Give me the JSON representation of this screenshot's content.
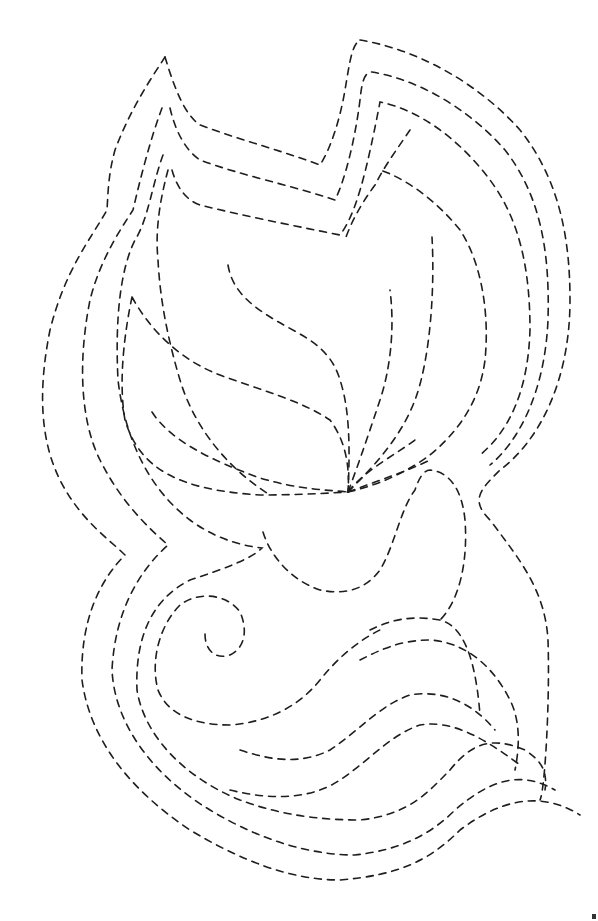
{
  "artwork": {
    "subject": "leaf and swirl quilting pattern",
    "style": "dashed stitch lines",
    "colors": {
      "background": "#ffffff",
      "stroke": "#1e1e1e"
    },
    "elements": [
      "outer-contour-1",
      "outer-contour-2",
      "outer-contour-3",
      "inner-contour-4",
      "leaf-outline",
      "leaf-vein-1",
      "leaf-vein-2",
      "leaf-vein-3",
      "leaf-vein-4",
      "center-curl",
      "swirl",
      "bottom-wave-1",
      "bottom-wave-2",
      "bottom-wave-3",
      "bottom-wave-4"
    ]
  }
}
